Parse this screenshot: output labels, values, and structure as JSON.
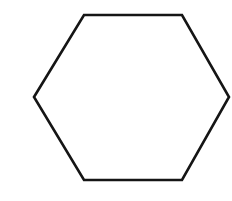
{
  "canvas": {
    "width": 232,
    "height": 201,
    "background_color": "#ffffff",
    "description": "Line drawing of a single hexagon outline on a plain white background"
  },
  "shape": {
    "name": "hexagon",
    "sides": 6,
    "orientation": "flat-top",
    "stroke_color": "#151515",
    "fill_color": "#ffffff",
    "stroke_width": 2.6,
    "vertices": [
      {
        "label": "left",
        "x": 34,
        "y": 97
      },
      {
        "label": "top-left",
        "x": 84,
        "y": 15
      },
      {
        "label": "top-right",
        "x": 182,
        "y": 15
      },
      {
        "label": "right",
        "x": 229,
        "y": 97
      },
      {
        "label": "bottom-right",
        "x": 182,
        "y": 180
      },
      {
        "label": "bottom-left",
        "x": 84,
        "y": 180
      }
    ],
    "points_attr": "34,97 84,15 182,15 229,97 182,180 84,180"
  }
}
